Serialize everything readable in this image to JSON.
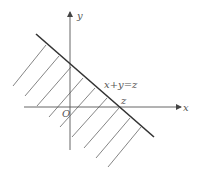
{
  "diagram": {
    "labels": {
      "y_axis": "y",
      "x_axis": "x",
      "origin": "O",
      "line_eq": "x+y=z",
      "intercept": "z"
    },
    "colors": {
      "axis": "#555555",
      "boundary": "#333333",
      "hatch": "#666666",
      "text": "#555555"
    },
    "shaded_region": "below-left of line x+y=z"
  }
}
